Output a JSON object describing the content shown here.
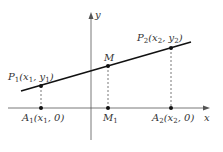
{
  "diagram": {
    "colors": {
      "axis": "#555555",
      "line": "#111111",
      "dashed": "#555555",
      "point": "#111111",
      "text": "#333333"
    },
    "axes": {
      "x_label": "x",
      "y_label": "y"
    },
    "points": [
      {
        "id": "P1",
        "name": "P",
        "sub": "1",
        "coords_text": "(x",
        "coords_sub": "1",
        "coords_mid": ", y",
        "coords_sub2": "1",
        "coords_end": ")"
      },
      {
        "id": "M",
        "name": "M"
      },
      {
        "id": "P2",
        "name": "P",
        "sub": "2",
        "coords_text": "(x",
        "coords_sub": "2",
        "coords_mid": ", y",
        "coords_sub2": "2",
        "coords_end": ")"
      },
      {
        "id": "A1",
        "name": "A",
        "sub": "1",
        "coords_text": "(x",
        "coords_sub": "1",
        "coords_mid": ", 0)"
      },
      {
        "id": "M1",
        "name": "M",
        "sub": "1"
      },
      {
        "id": "A2",
        "name": "A",
        "sub": "2",
        "coords_text": "(x",
        "coords_sub": "2",
        "coords_mid": ", 0)"
      }
    ]
  }
}
